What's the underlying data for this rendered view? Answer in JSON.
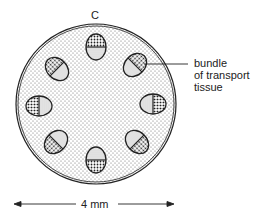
{
  "diagram": {
    "section_label": "C",
    "annotation": {
      "line1": "bundle",
      "line2": "of transport",
      "line3": "tissue"
    },
    "scale_label": "4 mm",
    "bundle_count": 8,
    "colors": {
      "stroke": "#222222",
      "background": "#ffffff",
      "stipple": "#555555"
    }
  }
}
